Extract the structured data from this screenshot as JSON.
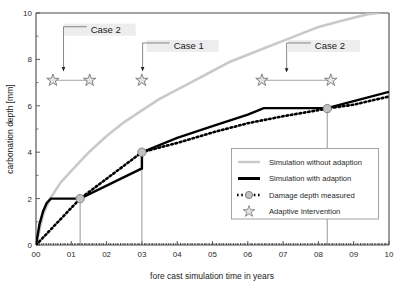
{
  "chart_data": {
    "type": "line",
    "title": "",
    "xlabel": "fore cast simulation time in years",
    "ylabel": "carbonation depth [mm]",
    "xlim": [
      0,
      10
    ],
    "ylim": [
      0,
      10
    ],
    "xticks": [
      "00",
      "01",
      "02",
      "03",
      "04",
      "05",
      "06",
      "07",
      "08",
      "09",
      "10"
    ],
    "xtick_values": [
      0,
      1,
      2,
      3,
      4,
      5,
      6,
      7,
      8,
      9,
      10
    ],
    "yticks": [
      "0",
      "2",
      "4",
      "6",
      "8",
      "10"
    ],
    "ytick_values": [
      0,
      2,
      4,
      6,
      8,
      10
    ],
    "grid": false,
    "legend_position": "lower-right",
    "series": [
      {
        "name": "Simulation without adaption",
        "style": "solid-light-gray",
        "color": "#c9c9c9",
        "points": [
          [
            0.0,
            0.0
          ],
          [
            0.2,
            1.3
          ],
          [
            0.4,
            2.0
          ],
          [
            0.7,
            2.7
          ],
          [
            1.0,
            3.2
          ],
          [
            1.5,
            4.0
          ],
          [
            2.0,
            4.7
          ],
          [
            2.5,
            5.3
          ],
          [
            3.0,
            5.8
          ],
          [
            3.5,
            6.3
          ],
          [
            4.0,
            6.7
          ],
          [
            4.5,
            7.1
          ],
          [
            5.0,
            7.5
          ],
          [
            5.5,
            7.9
          ],
          [
            6.0,
            8.2
          ],
          [
            6.5,
            8.5
          ],
          [
            7.0,
            8.8
          ],
          [
            7.5,
            9.1
          ],
          [
            8.0,
            9.4
          ],
          [
            8.5,
            9.6
          ],
          [
            9.0,
            9.8
          ],
          [
            9.4,
            9.95
          ],
          [
            9.7,
            10.0
          ]
        ]
      },
      {
        "name": "Simulation with adaption",
        "style": "solid-black-thick",
        "color": "#000000",
        "points": [
          [
            0.0,
            0.0
          ],
          [
            0.1,
            0.9
          ],
          [
            0.2,
            1.45
          ],
          [
            0.3,
            1.8
          ],
          [
            0.42,
            2.0
          ],
          [
            1.25,
            2.0
          ],
          [
            3.0,
            3.3
          ],
          [
            3.0,
            4.0
          ],
          [
            4.0,
            4.62
          ],
          [
            5.0,
            5.12
          ],
          [
            6.0,
            5.62
          ],
          [
            6.45,
            5.9
          ],
          [
            8.25,
            5.9
          ],
          [
            9.0,
            6.2
          ],
          [
            10.0,
            6.6
          ]
        ]
      },
      {
        "name": "Damage depth measured",
        "style": "dotted-black",
        "color": "#000000",
        "points": [
          [
            0.0,
            0.0
          ],
          [
            1.25,
            2.0
          ],
          [
            3.0,
            4.0
          ],
          [
            4.0,
            4.4
          ],
          [
            5.0,
            4.85
          ],
          [
            6.0,
            5.25
          ],
          [
            7.0,
            5.55
          ],
          [
            8.25,
            5.88
          ],
          [
            9.0,
            6.05
          ],
          [
            10.0,
            6.4
          ]
        ]
      }
    ],
    "markers": {
      "name": "Damage depth measured",
      "shape": "circle",
      "fill": "#c2c2c2",
      "points": [
        [
          1.25,
          2.0
        ],
        [
          3.0,
          4.0
        ],
        [
          8.25,
          5.88
        ]
      ]
    },
    "interventions": {
      "name": "Adaptive Intervention",
      "shape": "star",
      "y": 7.1,
      "x_values": [
        0.48,
        1.52,
        3.0,
        6.4,
        8.35
      ]
    },
    "connectors": [
      {
        "from_x": 0.48,
        "to_x": 1.52,
        "y": 7.1
      },
      {
        "from_x": 6.4,
        "to_x": 8.35,
        "y": 7.1
      }
    ],
    "annotations": [
      {
        "label": "Case 2",
        "text_x": 1.55,
        "text_y": 9.15,
        "target_x": 0.78,
        "target_y": 7.5
      },
      {
        "label": "Case 1",
        "text_x": 3.9,
        "text_y": 8.45,
        "target_x": 3.02,
        "target_y": 7.5
      },
      {
        "label": "Case 2",
        "text_x": 7.9,
        "text_y": 8.45,
        "target_x": 7.1,
        "target_y": 7.45
      }
    ]
  },
  "legend": {
    "entries": [
      {
        "label": "Simulation without adaption",
        "marker": "line-light-gray"
      },
      {
        "label": "Simulation with adaption",
        "marker": "line-black-thick"
      },
      {
        "label": "Damage depth measured",
        "marker": "dotted-with-circle"
      },
      {
        "label": "Adaptive Intervention",
        "marker": "star"
      }
    ]
  },
  "colors": {
    "no_adaption": "#c9c9c9",
    "with_adaption": "#000000",
    "measured": "#000000",
    "marker_fill": "#c2c2c2",
    "star_fill": "#e4e4e4",
    "axis": "#4a4a4a"
  }
}
